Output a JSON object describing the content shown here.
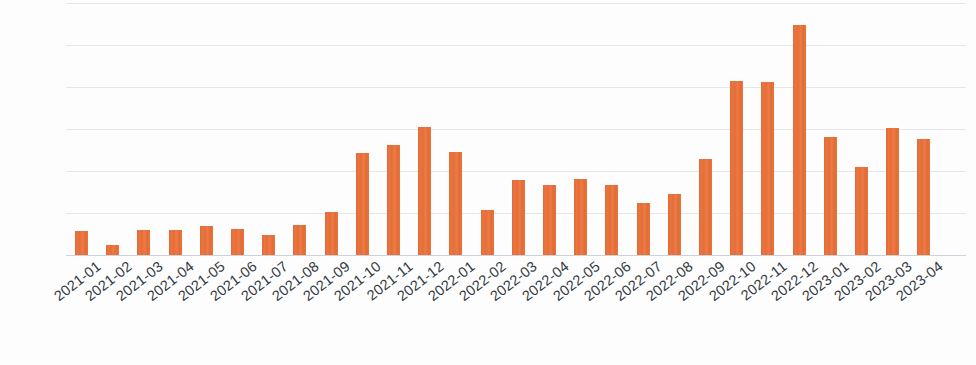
{
  "chart_data": {
    "type": "bar",
    "title": "",
    "subtitle": "",
    "xlabel": "",
    "ylabel": "",
    "legend": [],
    "legend_position": "none",
    "grid": true,
    "grid_axis": "y",
    "gridline_count": 6,
    "ylim": [
      0,
      6
    ],
    "yticks_visible": false,
    "bar_color": "#e8703a",
    "background_color": "#fdfdfd",
    "gridline_color": "#dde3ec",
    "axis_color": "#c9d2de",
    "label_color": "#333a42",
    "label_rotation_deg": -38,
    "categories": [
      "2021-01",
      "2021-02",
      "2021-03",
      "2021-04",
      "2021-05",
      "2021-06",
      "2021-07",
      "2021-08",
      "2021-09",
      "2021-10",
      "2021-11",
      "2021-12",
      "2022-01",
      "2022-02",
      "2022-03",
      "2022-04",
      "2022-05",
      "2022-06",
      "2022-07",
      "2022-08",
      "2022-09",
      "2022-10",
      "2022-11",
      "2022-12",
      "2023-01",
      "2023-02",
      "2023-03",
      "2023-04"
    ],
    "values": [
      0.57,
      0.24,
      0.6,
      0.6,
      0.69,
      0.62,
      0.48,
      0.71,
      1.02,
      2.43,
      2.62,
      3.05,
      2.45,
      1.07,
      1.79,
      1.67,
      1.81,
      1.67,
      1.24,
      1.45,
      2.29,
      4.14,
      4.12,
      5.48,
      2.81,
      2.1,
      3.02,
      2.76
    ]
  },
  "geometry": {
    "plot_left": 75,
    "bar_pitch": 31.2,
    "bar_width": 13,
    "baseline_y": 255,
    "unit_px": 42
  }
}
